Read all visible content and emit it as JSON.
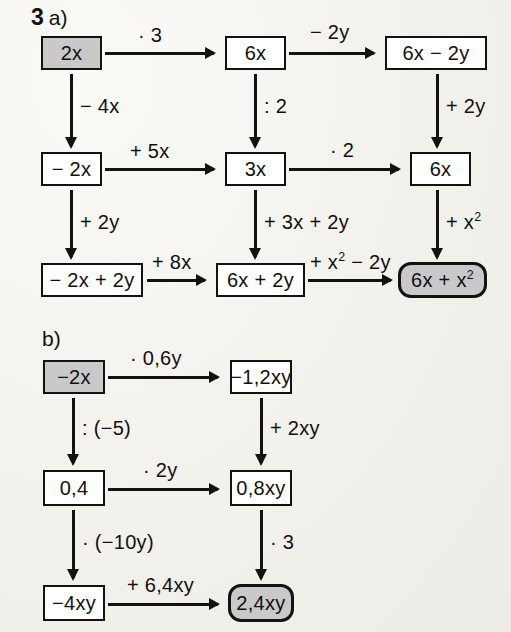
{
  "exercise": {
    "number": "3",
    "part_a_label": "a)",
    "part_b_label": "b)"
  },
  "palette": {
    "paper": "#f4f2ee",
    "ink": "#121212",
    "box_fill": "#ffffff",
    "highlight_fill": "#c9c9c9"
  },
  "part_a": {
    "nodes": {
      "start": "2x",
      "r1c2": "6x",
      "r1c3": "6x − 2y",
      "r2c1": "− 2x",
      "r2c2": "3x",
      "r2c3": "6x",
      "r3c1": "− 2x + 2y",
      "r3c2": "6x + 2y",
      "result_pre": "6x + x",
      "result_sup": "2"
    },
    "ops": {
      "a_r1_1": "· 3",
      "a_r1_2": "− 2y",
      "a_r2_1": "+ 5x",
      "a_r2_2": "· 2",
      "a_r3_1": "+ 8x",
      "a_r3_2_pre": "+ x",
      "a_r3_2_sup": "2",
      "a_r3_2_post": " − 2y",
      "a_v_c1_1": "− 4x",
      "a_v_c1_2": "+ 2y",
      "a_v_c2_1": ": 2",
      "a_v_c2_2": "+ 3x + 2y",
      "a_v_c3_1": "+ 2y",
      "a_v_c3_2_pre": "+ x",
      "a_v_c3_2_sup": "2"
    }
  },
  "part_b": {
    "nodes": {
      "start": "−2x",
      "r1c2": "−1,2xy",
      "r2c1": "0,4",
      "r2c2": "0,8xy",
      "r3c1": "−4xy",
      "result": "2,4xy"
    },
    "ops": {
      "b_r1_1": "· 0,6y",
      "b_r2_1": "· 2y",
      "b_r3_1": "+ 6,4xy",
      "b_v_c1_1": ": (−5)",
      "b_v_c1_2": "· (−10y)",
      "b_v_c2_1": "+ 2xy",
      "b_v_c2_2": "· 3"
    }
  }
}
